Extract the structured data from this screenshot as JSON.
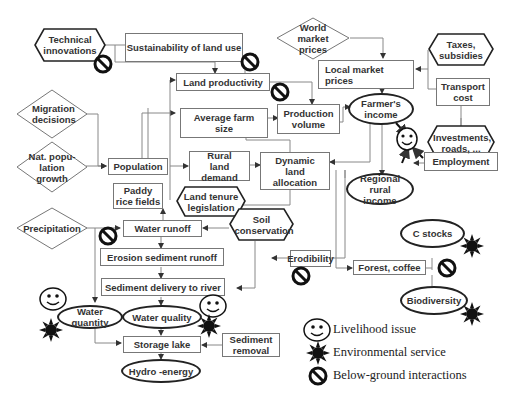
{
  "nodes": {
    "technical_innovations": "Technical innovations",
    "sustainability": "Sustainability of land use",
    "world_prices": "World market prices",
    "taxes": "Taxes, subsidies",
    "local_prices": "Local market prices",
    "transport_cost": "Transport cost",
    "land_productivity": "Land productivity",
    "migration": "Migration decisions",
    "avg_farm_size": "Average farm size",
    "production_volume": "Production volume",
    "farmers_income": "Farmer's income",
    "investments": "Investments, roads, ...",
    "nat_pop_growth": "Nat. popu-lation growth",
    "population": "Population",
    "rural_land_demand": "Rural land demand",
    "dynamic_land_allocation": "Dynamic land allocation",
    "regional_income": "Regional rural income",
    "employment": "Employment",
    "paddy": "Paddy rice fields",
    "land_tenure": "Land tenure legislation",
    "soil_conservation": "Soil conservation",
    "precipitation": "Precipitation",
    "water_runoff": "Water runoff",
    "c_stocks": "C stocks",
    "erosion": "Erosion sediment runoff",
    "erodibility": "Erodibility",
    "forest_coffee": "Forest, coffee",
    "sediment_delivery": "Sediment delivery to river",
    "biodiversity": "Biodiversity",
    "water_quantity": "Water quantity",
    "water_quality": "Water quality",
    "storage_lake": "Storage lake",
    "sediment_removal": "Sediment removal",
    "hydro_energy": "Hydro -energy"
  },
  "legend": {
    "livelihood": "Livelihood issue",
    "environmental": "Environmental service",
    "below_ground": "Below-ground interactions"
  },
  "colors": {
    "line": "#777777",
    "ellipse_border": "#222222",
    "text": "#333333"
  }
}
